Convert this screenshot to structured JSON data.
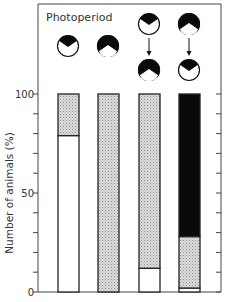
{
  "chart_data": {
    "type": "bar",
    "stacked": true,
    "title": "Photoperiod",
    "xlabel": "",
    "ylabel": "Number of animals (%)",
    "ylim": [
      0,
      100
    ],
    "yticks": [
      0,
      50,
      100
    ],
    "minor_tick_step": 10,
    "grid": false,
    "legend": null,
    "categories": [
      {
        "name": "Short day",
        "icons": [
          "short-day"
        ]
      },
      {
        "name": "Long day",
        "icons": [
          "long-day"
        ]
      },
      {
        "name": "Short day to Long day",
        "icons": [
          "short-day",
          "long-day"
        ]
      },
      {
        "name": "Long day to Short day",
        "icons": [
          "long-day",
          "short-day"
        ]
      }
    ],
    "series": [
      {
        "name": "white",
        "fill": "#ffffff",
        "values": [
          79,
          0,
          12,
          2
        ]
      },
      {
        "name": "stippled",
        "fill": "stipple",
        "values": [
          21,
          100,
          88,
          26
        ]
      },
      {
        "name": "black",
        "fill": "#0a0a0a",
        "values": [
          0,
          0,
          0,
          72
        ]
      }
    ]
  },
  "labels": {
    "title": "Photoperiod",
    "ylabel": "Number of animals (%)",
    "tick_0": "0",
    "tick_50": "50",
    "tick_100": "100"
  },
  "colors": {
    "axis": "#333333",
    "black_fill": "#0a0a0a",
    "stipple_bg": "#d8d8d8",
    "stipple_dot": "#9a9a9a"
  }
}
